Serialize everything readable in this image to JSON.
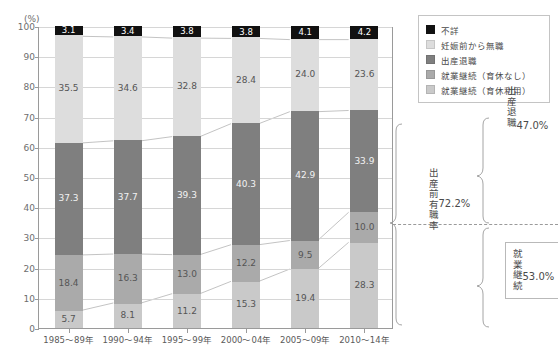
{
  "header": {
    "cropped_title_left": "····",
    "cropped_title_right": "·······················",
    "unit_label": "(%)"
  },
  "legend": {
    "items": [
      {
        "label": "不詳",
        "key": "fusho",
        "color": "#111111"
      },
      {
        "label": "妊娠前から無職",
        "key": "mushoku",
        "color": "#dddddd"
      },
      {
        "label": "出産退職",
        "key": "taishoku",
        "color": "#7f7f7f"
      },
      {
        "label": "就業継続（育休なし）",
        "key": "nashi",
        "color": "#aaaaaa"
      },
      {
        "label": "就業継続（育休利用）",
        "key": "ikukyu",
        "color": "#c9c9c9"
      }
    ]
  },
  "annotations": {
    "shussan_mae_yushoku_ritsu": {
      "label": "出産前有職率",
      "value": "72.2%"
    },
    "shussan_taishoku": {
      "label": "出産退職",
      "value": "47.0%"
    },
    "shugyo_keizoku": {
      "label": "就業継続",
      "value": "53.0%"
    }
  },
  "chart_data": {
    "type": "bar",
    "stacked": true,
    "title": "",
    "xlabel": "",
    "ylabel": "(%)",
    "ylim": [
      0,
      100
    ],
    "yticks": [
      0,
      10,
      20,
      30,
      40,
      50,
      60,
      70,
      80,
      90,
      100
    ],
    "ytick_labels": [
      "0",
      "10",
      "20",
      "30",
      "40",
      "50",
      "60",
      "70",
      "80",
      "90",
      "100"
    ],
    "grid": true,
    "legend_position": "top-right",
    "categories": [
      "1985～89年",
      "1990～94年",
      "1995～99年",
      "2000～04年",
      "2005～09年",
      "2010～14年"
    ],
    "series": [
      {
        "name": "就業継続（育休利用）",
        "key": "ikukyu",
        "color": "#c9c9c9",
        "values": [
          5.7,
          8.1,
          11.2,
          15.3,
          19.4,
          28.3
        ]
      },
      {
        "name": "就業継続（育休なし）",
        "key": "nashi",
        "color": "#aaaaaa",
        "values": [
          18.4,
          16.3,
          13.0,
          12.2,
          9.5,
          10.0
        ]
      },
      {
        "name": "出産退職",
        "key": "taishoku",
        "color": "#7f7f7f",
        "values": [
          37.3,
          37.7,
          39.3,
          40.3,
          42.9,
          33.9
        ]
      },
      {
        "name": "妊娠前から無職",
        "key": "mushoku",
        "color": "#dddddd",
        "values": [
          35.5,
          34.6,
          32.8,
          28.4,
          24.0,
          23.6
        ]
      },
      {
        "name": "不詳",
        "key": "fusho",
        "color": "#111111",
        "values": [
          3.1,
          3.4,
          3.8,
          3.8,
          4.1,
          4.2
        ]
      }
    ]
  }
}
